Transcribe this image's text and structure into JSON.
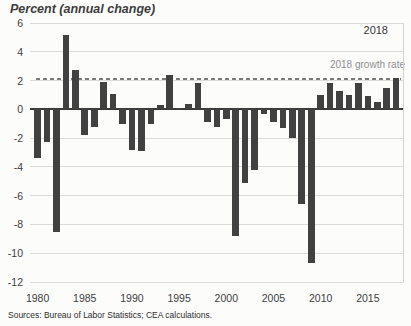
{
  "title": "Percent (annual change)",
  "source_note": "Sources: Bureau of Labor Statistics; CEA calculations.",
  "annotations": {
    "last_year_label": "2018",
    "reference_line_label": "2018 growth rate"
  },
  "colors": {
    "background": "#fcfcfb",
    "bar": "#414141",
    "zero_line": "#3a3a3a",
    "gridline": "#dbdbd9",
    "reference_line": "#7b7b7b",
    "plot_right_border": "#d3d3d1",
    "title_text": "#3c3c3c",
    "axis_text": "#404040",
    "annotation_year_text": "#363636",
    "reference_label_text": "#8f8f8f",
    "source_text": "#2e2e2e"
  },
  "chart_data": {
    "type": "bar",
    "title": "Percent (annual change)",
    "x": [
      1980,
      1981,
      1982,
      1983,
      1984,
      1985,
      1986,
      1987,
      1988,
      1989,
      1990,
      1991,
      1992,
      1993,
      1994,
      1995,
      1996,
      1997,
      1998,
      1999,
      2000,
      2001,
      2002,
      2003,
      2004,
      2005,
      2006,
      2007,
      2008,
      2009,
      2010,
      2011,
      2012,
      2013,
      2014,
      2015,
      2016,
      2017,
      2018
    ],
    "values": [
      -3.4,
      -2.3,
      -8.5,
      5.2,
      2.7,
      -1.8,
      -1.2,
      1.9,
      1.1,
      -1.0,
      -2.8,
      -2.9,
      -1.0,
      0.3,
      2.4,
      0.1,
      0.4,
      1.8,
      -0.9,
      -1.2,
      -0.7,
      -8.8,
      -5.1,
      -4.2,
      -0.3,
      -0.9,
      -1.3,
      -2.0,
      -6.6,
      -10.7,
      1.0,
      1.8,
      1.3,
      1.0,
      1.8,
      0.9,
      0.5,
      1.5,
      2.2
    ],
    "ylim": [
      -12,
      6
    ],
    "yticks": [
      6,
      4,
      2,
      0,
      -2,
      -4,
      -6,
      -8,
      -10,
      -12
    ],
    "xticks": [
      1980,
      1985,
      1990,
      1995,
      2000,
      2005,
      2010,
      2015
    ],
    "grid": true,
    "legend_position": "none",
    "reference_line": {
      "label": "2018 growth rate",
      "value": 2.1,
      "style": "dashed"
    }
  }
}
